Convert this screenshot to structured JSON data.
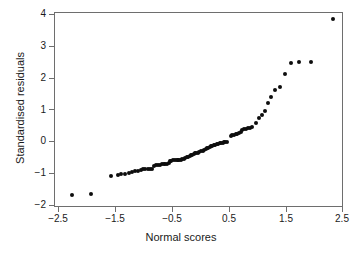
{
  "chart_data": {
    "type": "scatter",
    "title": "",
    "subtitle": "",
    "xlabel": "Normal scores",
    "ylabel": "Standardised residuals",
    "xlim": [
      -2.75,
      2.75
    ],
    "ylim": [
      -2.15,
      4.2
    ],
    "xticks": [
      -2.5,
      -1.5,
      -0.5,
      0.5,
      1.5,
      2.5
    ],
    "xticklabels": [
      "−2.5",
      "−1.5",
      "−0.5",
      "0.5",
      "1.5",
      "2.5"
    ],
    "yticks": [
      -2,
      -1,
      0,
      1,
      2,
      3,
      4
    ],
    "yticklabels": [
      "−2",
      "−1",
      "0",
      "1",
      "2",
      "3",
      "4"
    ],
    "grid": false,
    "legend": null,
    "marker": "filled-circle",
    "marker_color": "#0d0d0d",
    "marker_size_px": 4,
    "frame_color": "#6e6e6e",
    "background": "#ffffff",
    "n_points": 78,
    "annotations": [],
    "series": [
      {
        "name": "Standardised residuals vs normal scores",
        "points": [
          [
            -2.28,
            -1.66
          ],
          [
            -1.93,
            -1.62
          ],
          [
            -1.58,
            -1.07
          ],
          [
            -1.47,
            -1.05
          ],
          [
            -1.4,
            -1.01
          ],
          [
            -1.33,
            -1.0
          ],
          [
            -1.27,
            -0.96
          ],
          [
            -1.21,
            -0.94
          ],
          [
            -1.16,
            -0.92
          ],
          [
            -1.11,
            -0.9
          ],
          [
            -1.06,
            -0.88
          ],
          [
            -1.02,
            -0.86
          ],
          [
            -0.98,
            -0.85
          ],
          [
            -0.94,
            -0.85
          ],
          [
            -0.9,
            -0.84
          ],
          [
            -0.86,
            -0.84
          ],
          [
            -0.83,
            -0.74
          ],
          [
            -0.79,
            -0.73
          ],
          [
            -0.76,
            -0.72
          ],
          [
            -0.73,
            -0.71
          ],
          [
            -0.69,
            -0.7
          ],
          [
            -0.66,
            -0.7
          ],
          [
            -0.63,
            -0.69
          ],
          [
            -0.6,
            -0.68
          ],
          [
            -0.57,
            -0.67
          ],
          [
            -0.55,
            -0.6
          ],
          [
            -0.52,
            -0.59
          ],
          [
            -0.49,
            -0.58
          ],
          [
            -0.46,
            -0.58
          ],
          [
            -0.43,
            -0.57
          ],
          [
            -0.41,
            -0.57
          ],
          [
            -0.38,
            -0.56
          ],
          [
            -0.35,
            -0.55
          ],
          [
            -0.33,
            -0.54
          ],
          [
            -0.3,
            -0.52
          ],
          [
            -0.28,
            -0.5
          ],
          [
            -0.25,
            -0.48
          ],
          [
            -0.23,
            -0.46
          ],
          [
            -0.2,
            -0.44
          ],
          [
            -0.18,
            -0.42
          ],
          [
            -0.15,
            -0.4
          ],
          [
            -0.13,
            -0.38
          ],
          [
            -0.1,
            -0.36
          ],
          [
            -0.08,
            -0.34
          ],
          [
            -0.05,
            -0.33
          ],
          [
            -0.03,
            -0.31
          ],
          [
            0.0,
            -0.29
          ],
          [
            0.03,
            -0.27
          ],
          [
            0.05,
            -0.25
          ],
          [
            0.08,
            -0.22
          ],
          [
            0.1,
            -0.2
          ],
          [
            0.13,
            -0.18
          ],
          [
            0.15,
            -0.16
          ],
          [
            0.18,
            -0.14
          ],
          [
            0.2,
            -0.12
          ],
          [
            0.23,
            -0.1
          ],
          [
            0.25,
            -0.08
          ],
          [
            0.28,
            -0.06
          ],
          [
            0.3,
            -0.05
          ],
          [
            0.33,
            -0.04
          ],
          [
            0.35,
            -0.03
          ],
          [
            0.38,
            -0.02
          ],
          [
            0.41,
            -0.01
          ],
          [
            0.43,
            0.0
          ],
          [
            0.46,
            0.01
          ],
          [
            0.52,
            0.2
          ],
          [
            0.55,
            0.21
          ],
          [
            0.58,
            0.22
          ],
          [
            0.61,
            0.24
          ],
          [
            0.64,
            0.26
          ],
          [
            0.67,
            0.28
          ],
          [
            0.7,
            0.32
          ],
          [
            0.73,
            0.37
          ],
          [
            0.76,
            0.4
          ],
          [
            0.79,
            0.42
          ],
          [
            0.83,
            0.44
          ],
          [
            0.86,
            0.45
          ],
          [
            0.9,
            0.46
          ],
          [
            0.97,
            0.61
          ],
          [
            1.02,
            0.74
          ],
          [
            1.07,
            0.86
          ],
          [
            1.12,
            0.98
          ],
          [
            1.18,
            1.22
          ],
          [
            1.24,
            1.4
          ],
          [
            1.31,
            1.62
          ],
          [
            1.39,
            1.72
          ],
          [
            1.47,
            2.13
          ],
          [
            1.58,
            2.47
          ],
          [
            1.73,
            2.5
          ],
          [
            1.94,
            2.51
          ],
          [
            2.32,
            3.87
          ]
        ]
      }
    ]
  }
}
